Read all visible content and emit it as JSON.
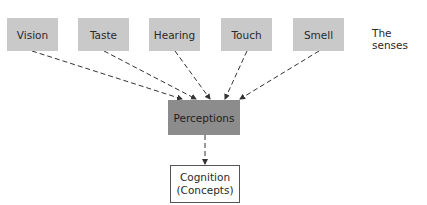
{
  "diagram": {
    "senses": [
      {
        "label": "Vision"
      },
      {
        "label": "Taste"
      },
      {
        "label": "Hearing"
      },
      {
        "label": "Touch"
      },
      {
        "label": "Smell"
      }
    ],
    "senses_caption": "The senses",
    "perceptions": {
      "label": "Perceptions"
    },
    "cognition": {
      "line1": "Cognition",
      "line2": "(Concepts)"
    },
    "edges": [
      {
        "from": "Vision",
        "to": "Perceptions",
        "style": "dashed"
      },
      {
        "from": "Taste",
        "to": "Perceptions",
        "style": "dashed"
      },
      {
        "from": "Hearing",
        "to": "Perceptions",
        "style": "dashed"
      },
      {
        "from": "Touch",
        "to": "Perceptions",
        "style": "dashed"
      },
      {
        "from": "Smell",
        "to": "Perceptions",
        "style": "dashed"
      },
      {
        "from": "Perceptions",
        "to": "Cognition",
        "style": "dashed"
      }
    ],
    "colors": {
      "sense_fill": "#c9c9c9",
      "perceptions_fill": "#8c8c8c",
      "cognition_fill": "#ffffff",
      "line": "#333333"
    }
  }
}
